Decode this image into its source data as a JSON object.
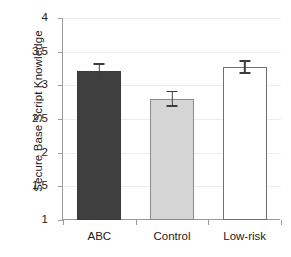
{
  "chart_data": {
    "type": "bar",
    "title": "",
    "xlabel": "",
    "ylabel": "Secure Base Script Knowledge",
    "categories": [
      "ABC",
      "Control",
      "Low-risk"
    ],
    "values": [
      3.21,
      2.8,
      3.27
    ],
    "errors": [
      0.12,
      0.12,
      0.1
    ],
    "bar_colors": [
      "#3f3f3f",
      "#d5d5d5",
      "#ffffff"
    ],
    "ylim": [
      1,
      4
    ],
    "yticks": [
      1,
      1.5,
      2,
      2.5,
      3,
      3.5,
      4
    ],
    "ytick_labels": [
      "1",
      "1.5",
      "2",
      "2.5",
      "3",
      "3.5",
      "4"
    ],
    "grid": true,
    "legend": "none",
    "error_bar_style": "symmetric-caps"
  },
  "axes": {
    "y_title": "Secure Base Script Knowledge",
    "axis_color": "#9a9a9a",
    "grid_color": "#ededed",
    "text_color": "#1a1a1a"
  }
}
